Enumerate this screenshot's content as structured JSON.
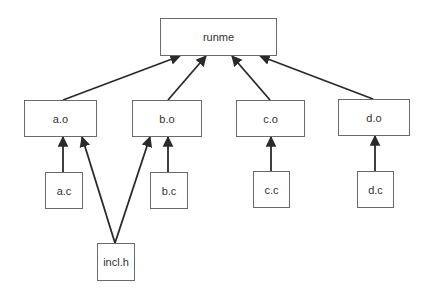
{
  "diagram": {
    "type": "dependency-graph",
    "colors": {
      "background": "#ffffff",
      "node_border": "#6a6a6a",
      "text": "#333333",
      "edge": "#2a2a2a"
    },
    "nodes": [
      {
        "id": "runme",
        "label": "runme",
        "x": 160,
        "y": 18,
        "w": 117,
        "h": 38
      },
      {
        "id": "a_o",
        "label": "a.o",
        "x": 24,
        "y": 100,
        "w": 73,
        "h": 37
      },
      {
        "id": "b_o",
        "label": "b.o",
        "x": 132,
        "y": 100,
        "w": 70,
        "h": 37
      },
      {
        "id": "c_o",
        "label": "c.o",
        "x": 236,
        "y": 100,
        "w": 69,
        "h": 37
      },
      {
        "id": "d_o",
        "label": "d.o",
        "x": 338,
        "y": 99,
        "w": 72,
        "h": 37
      },
      {
        "id": "a_c",
        "label": "a.c",
        "x": 45,
        "y": 172,
        "w": 38,
        "h": 37
      },
      {
        "id": "b_c",
        "label": "b.c",
        "x": 150,
        "y": 172,
        "w": 38,
        "h": 37
      },
      {
        "id": "c_c",
        "label": "c.c",
        "x": 253,
        "y": 171,
        "w": 37,
        "h": 37
      },
      {
        "id": "d_c",
        "label": "d.c",
        "x": 357,
        "y": 171,
        "w": 37,
        "h": 37
      },
      {
        "id": "incl_h",
        "label": "incl.h",
        "x": 97,
        "y": 243,
        "w": 38,
        "h": 38
      }
    ],
    "edges": [
      {
        "from": "a_o",
        "to": "runme",
        "x1": 63,
        "y1": 100,
        "x2": 180,
        "y2": 56
      },
      {
        "from": "b_o",
        "to": "runme",
        "x1": 168,
        "y1": 100,
        "x2": 206,
        "y2": 56
      },
      {
        "from": "c_o",
        "to": "runme",
        "x1": 270,
        "y1": 100,
        "x2": 232,
        "y2": 56
      },
      {
        "from": "d_o",
        "to": "runme",
        "x1": 373,
        "y1": 99,
        "x2": 260,
        "y2": 56
      },
      {
        "from": "a_c",
        "to": "a_o",
        "x1": 63,
        "y1": 172,
        "x2": 63,
        "y2": 137
      },
      {
        "from": "incl_h",
        "to": "a_o",
        "x1": 115,
        "y1": 243,
        "x2": 82,
        "y2": 137
      },
      {
        "from": "incl_h",
        "to": "b_o",
        "x1": 115,
        "y1": 243,
        "x2": 150,
        "y2": 137
      },
      {
        "from": "b_c",
        "to": "b_o",
        "x1": 168,
        "y1": 172,
        "x2": 168,
        "y2": 137
      },
      {
        "from": "c_c",
        "to": "c_o",
        "x1": 271,
        "y1": 171,
        "x2": 271,
        "y2": 137
      },
      {
        "from": "d_c",
        "to": "d_o",
        "x1": 375,
        "y1": 171,
        "x2": 375,
        "y2": 136
      }
    ]
  }
}
